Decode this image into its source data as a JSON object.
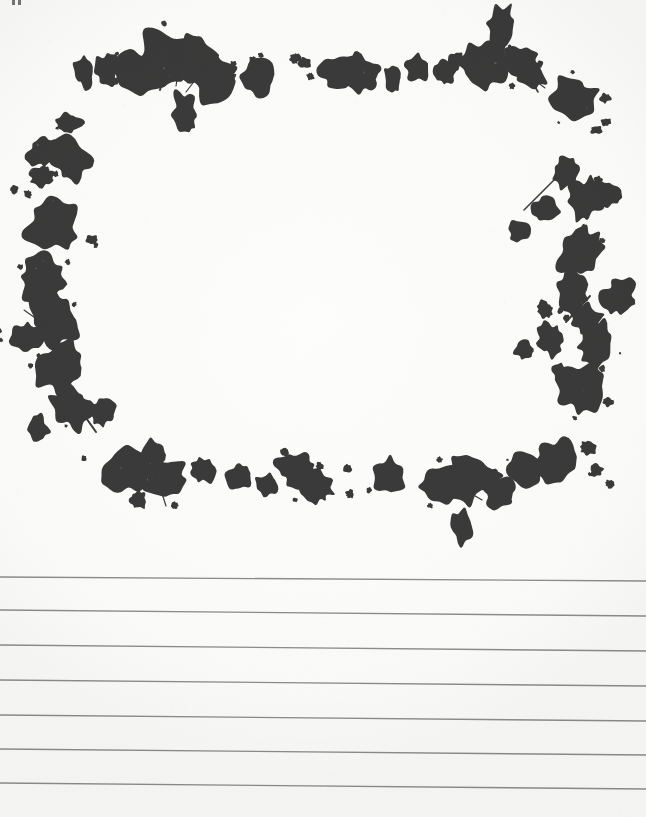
{
  "document": {
    "kind": "scanned-lined-paper",
    "title": "Ink Splatter Border Lined Paper",
    "page_width": 646,
    "page_height": 817,
    "paper_color": "#fdfdfc",
    "ink_color": "#3a3a3a",
    "rule_color": "#8d8d8d"
  },
  "border": {
    "name": "ink-splatter-frame",
    "description": "Hand-made ink splatter border framing a blank rectangular writing area",
    "region": {
      "x": 0,
      "y": 0,
      "width": 646,
      "height": 560
    },
    "inner_blank_area": {
      "x": 110,
      "y": 120,
      "width": 400,
      "height": 300
    }
  },
  "edge_artifacts": [
    {
      "name": "scan-tick-1",
      "x": 12,
      "y": 0
    },
    {
      "name": "scan-tick-2",
      "x": 18,
      "y": 0
    }
  ],
  "ruled_lines": {
    "count": 7,
    "color": "#8d8d8d",
    "thickness": 1.4,
    "slant_px": 4,
    "lines": [
      {
        "index": 1,
        "y_left": 577,
        "y_right": 581
      },
      {
        "index": 2,
        "y_left": 610,
        "y_right": 616
      },
      {
        "index": 3,
        "y_left": 645,
        "y_right": 651
      },
      {
        "index": 4,
        "y_left": 680,
        "y_right": 686
      },
      {
        "index": 5,
        "y_left": 715,
        "y_right": 721
      },
      {
        "index": 6,
        "y_left": 749,
        "y_right": 755
      },
      {
        "index": 7,
        "y_left": 783,
        "y_right": 789
      }
    ]
  },
  "ink_shapes": {
    "top": [
      {
        "cx": 83,
        "cy": 72,
        "rx": 9,
        "ry": 13,
        "rot": -12
      },
      {
        "cx": 107,
        "cy": 70,
        "rx": 11,
        "ry": 14,
        "rot": 8
      },
      {
        "cx": 140,
        "cy": 73,
        "rx": 20,
        "ry": 22,
        "rot": -20
      },
      {
        "cx": 166,
        "cy": 60,
        "rx": 28,
        "ry": 26,
        "rot": 15
      },
      {
        "cx": 196,
        "cy": 62,
        "rx": 24,
        "ry": 26,
        "rot": -8
      },
      {
        "cx": 215,
        "cy": 78,
        "rx": 22,
        "ry": 21,
        "rot": 22
      },
      {
        "cx": 185,
        "cy": 113,
        "rx": 11,
        "ry": 19,
        "rot": -8
      },
      {
        "cx": 258,
        "cy": 77,
        "rx": 16,
        "ry": 19,
        "rot": 5
      },
      {
        "cx": 295,
        "cy": 58,
        "rx": 5,
        "ry": 5,
        "rot": 0
      },
      {
        "cx": 305,
        "cy": 63,
        "rx": 7,
        "ry": 5,
        "rot": 18
      },
      {
        "cx": 340,
        "cy": 70,
        "rx": 21,
        "ry": 17,
        "rot": -15
      },
      {
        "cx": 362,
        "cy": 74,
        "rx": 16,
        "ry": 18,
        "rot": 10
      },
      {
        "cx": 393,
        "cy": 78,
        "rx": 8,
        "ry": 13,
        "rot": -14
      },
      {
        "cx": 417,
        "cy": 68,
        "rx": 11,
        "ry": 14,
        "rot": 6
      },
      {
        "cx": 444,
        "cy": 72,
        "rx": 10,
        "ry": 12,
        "rot": -20
      },
      {
        "cx": 456,
        "cy": 60,
        "rx": 7,
        "ry": 9,
        "rot": 12
      },
      {
        "cx": 482,
        "cy": 65,
        "rx": 23,
        "ry": 22,
        "rot": -10
      },
      {
        "cx": 500,
        "cy": 25,
        "rx": 13,
        "ry": 20,
        "rot": 8
      },
      {
        "cx": 498,
        "cy": 50,
        "rx": 8,
        "ry": 14,
        "rot": -6
      },
      {
        "cx": 519,
        "cy": 60,
        "rx": 16,
        "ry": 14,
        "rot": 18
      },
      {
        "cx": 532,
        "cy": 74,
        "rx": 14,
        "ry": 16,
        "rot": -12
      },
      {
        "cx": 572,
        "cy": 100,
        "rx": 22,
        "ry": 21,
        "rot": 14
      },
      {
        "cx": 605,
        "cy": 98,
        "rx": 5,
        "ry": 5,
        "rot": 0
      },
      {
        "cx": 606,
        "cy": 122,
        "rx": 4,
        "ry": 4,
        "rot": 0
      },
      {
        "cx": 596,
        "cy": 130,
        "rx": 5,
        "ry": 4,
        "rot": 0
      }
    ],
    "left": [
      {
        "cx": 68,
        "cy": 122,
        "rx": 12,
        "ry": 10,
        "rot": 12
      },
      {
        "cx": 45,
        "cy": 152,
        "rx": 17,
        "ry": 15,
        "rot": -18
      },
      {
        "cx": 72,
        "cy": 160,
        "rx": 20,
        "ry": 18,
        "rot": 10
      },
      {
        "cx": 42,
        "cy": 177,
        "rx": 12,
        "ry": 10,
        "rot": 0
      },
      {
        "cx": 14,
        "cy": 190,
        "rx": 4,
        "ry": 4,
        "rot": 0
      },
      {
        "cx": 28,
        "cy": 194,
        "rx": 4,
        "ry": 4,
        "rot": 0
      },
      {
        "cx": 52,
        "cy": 228,
        "rx": 25,
        "ry": 23,
        "rot": -12
      },
      {
        "cx": 40,
        "cy": 262,
        "rx": 6,
        "ry": 6,
        "rot": 0
      },
      {
        "cx": 92,
        "cy": 240,
        "rx": 6,
        "ry": 5,
        "rot": 0
      },
      {
        "cx": 44,
        "cy": 282,
        "rx": 22,
        "ry": 22,
        "rot": 14
      },
      {
        "cx": 54,
        "cy": 320,
        "rx": 20,
        "ry": 25,
        "rot": -20
      },
      {
        "cx": 28,
        "cy": 338,
        "rx": 16,
        "ry": 14,
        "rot": 10
      },
      {
        "cx": 62,
        "cy": 366,
        "rx": 22,
        "ry": 26,
        "rot": 16
      },
      {
        "cx": 72,
        "cy": 406,
        "rx": 18,
        "ry": 20,
        "rot": -10
      },
      {
        "cx": 38,
        "cy": 428,
        "rx": 10,
        "ry": 12,
        "rot": 0
      },
      {
        "cx": 102,
        "cy": 412,
        "rx": 12,
        "ry": 13,
        "rot": 0
      }
    ],
    "right": [
      {
        "cx": 566,
        "cy": 172,
        "rx": 13,
        "ry": 16,
        "rot": 10
      },
      {
        "cx": 545,
        "cy": 210,
        "rx": 12,
        "ry": 12,
        "rot": -12
      },
      {
        "cx": 586,
        "cy": 200,
        "rx": 16,
        "ry": 20,
        "rot": 16
      },
      {
        "cx": 520,
        "cy": 232,
        "rx": 10,
        "ry": 11,
        "rot": 0
      },
      {
        "cx": 608,
        "cy": 196,
        "rx": 13,
        "ry": 12,
        "rot": -8
      },
      {
        "cx": 580,
        "cy": 252,
        "rx": 18,
        "ry": 24,
        "rot": 12
      },
      {
        "cx": 572,
        "cy": 292,
        "rx": 16,
        "ry": 22,
        "rot": -14
      },
      {
        "cx": 586,
        "cy": 318,
        "rx": 14,
        "ry": 16,
        "rot": 8
      },
      {
        "cx": 620,
        "cy": 296,
        "rx": 14,
        "ry": 18,
        "rot": 20
      },
      {
        "cx": 545,
        "cy": 310,
        "rx": 8,
        "ry": 8,
        "rot": 0
      },
      {
        "cx": 550,
        "cy": 340,
        "rx": 12,
        "ry": 14,
        "rot": -10
      },
      {
        "cx": 525,
        "cy": 350,
        "rx": 9,
        "ry": 9,
        "rot": 0
      },
      {
        "cx": 596,
        "cy": 344,
        "rx": 16,
        "ry": 22,
        "rot": 10
      },
      {
        "cx": 580,
        "cy": 386,
        "rx": 22,
        "ry": 22,
        "rot": -8
      },
      {
        "cx": 560,
        "cy": 372,
        "rx": 8,
        "ry": 7,
        "rot": 0
      },
      {
        "cx": 608,
        "cy": 402,
        "rx": 5,
        "ry": 5,
        "rot": 0
      }
    ],
    "bottom": [
      {
        "cx": 128,
        "cy": 470,
        "rx": 24,
        "ry": 20,
        "rot": -12
      },
      {
        "cx": 152,
        "cy": 455,
        "rx": 11,
        "ry": 13,
        "rot": 10
      },
      {
        "cx": 166,
        "cy": 480,
        "rx": 22,
        "ry": 18,
        "rot": 14
      },
      {
        "cx": 138,
        "cy": 500,
        "rx": 8,
        "ry": 9,
        "rot": 0
      },
      {
        "cx": 202,
        "cy": 470,
        "rx": 12,
        "ry": 13,
        "rot": -6
      },
      {
        "cx": 240,
        "cy": 476,
        "rx": 11,
        "ry": 12,
        "rot": 8
      },
      {
        "cx": 266,
        "cy": 486,
        "rx": 8,
        "ry": 12,
        "rot": -18
      },
      {
        "cx": 298,
        "cy": 470,
        "rx": 18,
        "ry": 17,
        "rot": 12
      },
      {
        "cx": 316,
        "cy": 486,
        "rx": 15,
        "ry": 16,
        "rot": -10
      },
      {
        "cx": 348,
        "cy": 468,
        "rx": 4,
        "ry": 4,
        "rot": 0
      },
      {
        "cx": 350,
        "cy": 494,
        "rx": 4,
        "ry": 4,
        "rot": 0
      },
      {
        "cx": 390,
        "cy": 478,
        "rx": 16,
        "ry": 17,
        "rot": 10
      },
      {
        "cx": 440,
        "cy": 485,
        "rx": 22,
        "ry": 19,
        "rot": -14
      },
      {
        "cx": 470,
        "cy": 478,
        "rx": 24,
        "ry": 22,
        "rot": 12
      },
      {
        "cx": 462,
        "cy": 528,
        "rx": 10,
        "ry": 17,
        "rot": -8
      },
      {
        "cx": 500,
        "cy": 492,
        "rx": 14,
        "ry": 16,
        "rot": 18
      },
      {
        "cx": 524,
        "cy": 470,
        "rx": 17,
        "ry": 18,
        "rot": -10
      },
      {
        "cx": 556,
        "cy": 460,
        "rx": 20,
        "ry": 19,
        "rot": 8
      },
      {
        "cx": 588,
        "cy": 448,
        "rx": 8,
        "ry": 8,
        "rot": 0
      },
      {
        "cx": 596,
        "cy": 470,
        "rx": 6,
        "ry": 6,
        "rot": 0
      },
      {
        "cx": 610,
        "cy": 484,
        "rx": 4,
        "ry": 4,
        "rot": 0
      }
    ],
    "splashes": [
      {
        "name": "splash-top-left",
        "x1": 172,
        "y1": 48,
        "x2": 160,
        "y2": 90
      },
      {
        "name": "splash-top-left-2",
        "x1": 182,
        "y1": 46,
        "x2": 176,
        "y2": 86
      },
      {
        "name": "splash-top-mid",
        "x1": 206,
        "y1": 66,
        "x2": 186,
        "y2": 92
      },
      {
        "name": "splash-top-right",
        "x1": 513,
        "y1": 64,
        "x2": 545,
        "y2": 88
      },
      {
        "name": "splash-top-right-2",
        "x1": 520,
        "y1": 60,
        "x2": 538,
        "y2": 92
      },
      {
        "name": "splash-right-upper",
        "x1": 556,
        "y1": 178,
        "x2": 524,
        "y2": 210
      },
      {
        "name": "splash-right-mid",
        "x1": 590,
        "y1": 296,
        "x2": 566,
        "y2": 322
      },
      {
        "name": "splash-left-mid",
        "x1": 52,
        "y1": 330,
        "x2": 24,
        "y2": 310
      },
      {
        "name": "splash-left-lower",
        "x1": 72,
        "y1": 398,
        "x2": 96,
        "y2": 432
      },
      {
        "name": "splash-bottom-left",
        "x1": 152,
        "y1": 462,
        "x2": 166,
        "y2": 506
      },
      {
        "name": "splash-bottom-mid",
        "x1": 448,
        "y1": 480,
        "x2": 482,
        "y2": 500
      }
    ]
  }
}
